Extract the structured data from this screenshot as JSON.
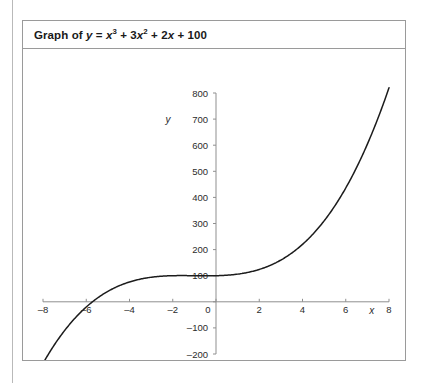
{
  "figure": {
    "title_parts": {
      "prefix": "Graph of ",
      "y": "y",
      "equals": " = ",
      "term1_base": "x",
      "term1_exp": "3",
      "plus1": " + 3",
      "term2_base": "x",
      "term2_exp": "2",
      "plus2": " + 2",
      "term3_base": "x",
      "plus3": " + 100"
    },
    "title_plain": "Graph of y = x^3 + 3x^2 + 2x + 100"
  },
  "chart_data": {
    "type": "line",
    "xlabel": "x",
    "ylabel": "y",
    "xlim": [
      -8,
      8
    ],
    "ylim": [
      -200,
      800
    ],
    "grid": false,
    "legend": "none",
    "function": "y = x^3 + 3x^2 + 2x + 100",
    "coefficients": {
      "x3": 1,
      "x2": 3,
      "x1": 2,
      "x0": 100
    },
    "x_ticks": [
      -8,
      -6,
      -4,
      -2,
      0,
      2,
      4,
      6,
      8
    ],
    "x_tick_labels": [
      "-8",
      "-6",
      "-4",
      "-2",
      "0",
      "2",
      "4",
      "6",
      "8"
    ],
    "y_ticks": [
      -200,
      -100,
      0,
      100,
      200,
      300,
      400,
      500,
      600,
      700,
      800
    ],
    "y_tick_labels": [
      "-200",
      "-100",
      "0",
      "100",
      "200",
      "300",
      "400",
      "500",
      "600",
      "700",
      "800"
    ],
    "y_tick_labels_visible": [
      "800",
      "700",
      "600",
      "500",
      "400",
      "300",
      "200",
      "100",
      "0",
      "-100",
      "-200"
    ],
    "series": [
      {
        "name": "y = x^3 + 3x^2 + 2x + 100",
        "color": "#1c1c1c",
        "x": [
          -8,
          -7.5,
          -7,
          -6.5,
          -6,
          -5.5,
          -5,
          -4.5,
          -4,
          -3.5,
          -3,
          -2.5,
          -2,
          -1.5,
          -1,
          -0.5,
          0,
          0.5,
          1,
          1.5,
          2,
          2.5,
          3,
          3.5,
          4,
          4.5,
          5,
          5.5,
          6,
          6.5,
          7,
          7.5,
          8
        ],
        "y": [
          -236,
          -168,
          -110,
          -61,
          -20,
          13,
          40,
          60.6,
          76,
          86.6,
          94,
          98.1,
          100,
          100.4,
          100,
          99.4,
          100,
          101.9,
          106,
          113.1,
          124,
          139.4,
          160,
          186.6,
          220,
          260.6,
          310,
          368.1,
          436,
          514.4,
          604,
          705.6,
          820
        ],
        "x_intercept": -6.14,
        "y_intercept": 100,
        "local_max": {
          "x": -1.12,
          "y": 100.39
        },
        "local_min": {
          "x": -0.55,
          "y": 99.74
        }
      }
    ],
    "axes_style": {
      "axis_color": "#8f8f8f",
      "curve_color": "#1c1c1c",
      "background": "#ffffff"
    }
  }
}
